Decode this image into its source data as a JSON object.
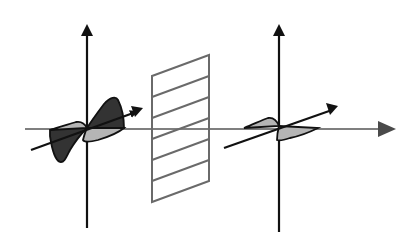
{
  "diagram": {
    "colors": {
      "background": "#ffffff",
      "axis": "#111111",
      "propagation_axis": "#555555",
      "lobe_dark": "#333333",
      "lobe_light": "#b5b5b5",
      "polarizer": "#6a6a6a"
    },
    "elements": [
      {
        "id": "unpolarized-wave",
        "label": "Unpolarized wave (left)"
      },
      {
        "id": "polarizer",
        "label": "Polarizer grid"
      },
      {
        "id": "polarized-wave",
        "label": "Polarized wave (right)"
      },
      {
        "id": "propagation-axis",
        "label": "Propagation direction"
      }
    ]
  }
}
